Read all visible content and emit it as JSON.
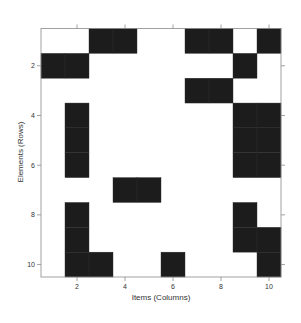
{
  "chart_data": {
    "type": "heatmap",
    "title": "",
    "xlabel": "Items (Columns)",
    "ylabel": "Elements (Rows)",
    "n_rows": 10,
    "n_cols": 10,
    "x_ticks": [
      2,
      4,
      6,
      8,
      10
    ],
    "y_ticks": [
      2,
      4,
      6,
      8,
      10
    ],
    "xlim": [
      0.5,
      10.5
    ],
    "ylim": [
      10.5,
      0.5
    ],
    "grid": false,
    "legend": null,
    "fill_color": "#1c1c1c",
    "empty_color": "#ffffff",
    "matrix": [
      [
        0,
        0,
        1,
        1,
        0,
        0,
        1,
        1,
        0,
        1
      ],
      [
        1,
        1,
        0,
        0,
        0,
        0,
        0,
        0,
        1,
        0
      ],
      [
        0,
        0,
        0,
        0,
        0,
        0,
        1,
        1,
        0,
        0
      ],
      [
        0,
        1,
        0,
        0,
        0,
        0,
        0,
        0,
        1,
        1
      ],
      [
        0,
        1,
        0,
        0,
        0,
        0,
        0,
        0,
        1,
        1
      ],
      [
        0,
        1,
        0,
        0,
        0,
        0,
        0,
        0,
        1,
        1
      ],
      [
        0,
        0,
        0,
        1,
        1,
        0,
        0,
        0,
        0,
        0
      ],
      [
        0,
        1,
        0,
        0,
        0,
        0,
        0,
        0,
        1,
        0
      ],
      [
        0,
        1,
        0,
        0,
        0,
        0,
        0,
        0,
        1,
        1
      ],
      [
        0,
        1,
        1,
        0,
        0,
        1,
        0,
        0,
        0,
        1
      ]
    ]
  },
  "axes": {
    "xlabel": "Items (Columns)",
    "ylabel": "Elements (Rows)"
  }
}
